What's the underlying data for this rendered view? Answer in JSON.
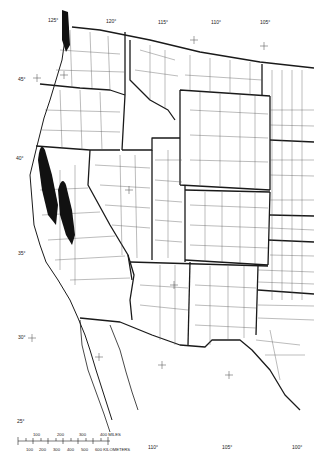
{
  "map": {
    "title": "",
    "region": "Western United States county boundaries",
    "colors": {
      "background": "#ffffff",
      "line": "#1a1a1a",
      "shading": "#111111"
    },
    "graticule_labels": {
      "top": [
        "125°",
        "120°",
        "115°",
        "110°",
        "105°"
      ],
      "left": [
        "45°",
        "40°",
        "35°",
        "30°",
        "25°"
      ],
      "bottom": [
        "110°",
        "105°",
        "100°"
      ]
    },
    "scale_bar": {
      "miles_ticks": [
        "100",
        "200",
        "300",
        "400 MILES"
      ],
      "km_ticks": [
        "100",
        "200",
        "300",
        "400",
        "500",
        "600 KILOMETERS"
      ]
    }
  }
}
